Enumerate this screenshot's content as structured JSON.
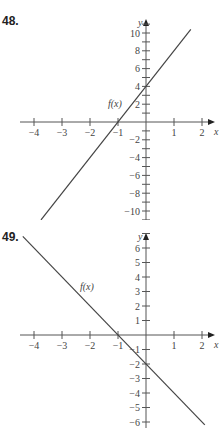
{
  "problems": [
    {
      "number": "48."
    },
    {
      "number": "49."
    }
  ],
  "chart_data": [
    {
      "type": "line",
      "title": "48.",
      "xlabel": "x",
      "ylabel": "y",
      "curve_label": "f(x)",
      "x_ticks": [
        -4,
        -3,
        -2,
        -1,
        1,
        2
      ],
      "y_ticks": [
        10,
        8,
        6,
        4,
        2,
        -2,
        -4,
        -6,
        -8,
        -10
      ],
      "xlim": [
        -4.2,
        2.3
      ],
      "ylim": [
        -11.5,
        11.5
      ],
      "series": [
        {
          "name": "f(x)",
          "x": [
            -3.75,
            1.6
          ],
          "y": [
            -11,
            10.4
          ]
        }
      ],
      "equation": "f(x) = 4x + 4"
    },
    {
      "type": "line",
      "title": "49.",
      "xlabel": "x",
      "ylabel": "y",
      "curve_label": "f(x)",
      "x_ticks": [
        -4,
        -3,
        -2,
        -1,
        1,
        2
      ],
      "y_ticks": [
        6,
        5,
        4,
        3,
        2,
        1,
        -1,
        -2,
        -3,
        -4,
        -5,
        -6
      ],
      "xlim": [
        -4.2,
        2.3
      ],
      "ylim": [
        -6.5,
        7
      ],
      "series": [
        {
          "name": "f(x)",
          "x": [
            -4.4,
            2.1
          ],
          "y": [
            6.8,
            -6.2
          ]
        }
      ],
      "equation": "f(x) = -2x - 2"
    }
  ]
}
